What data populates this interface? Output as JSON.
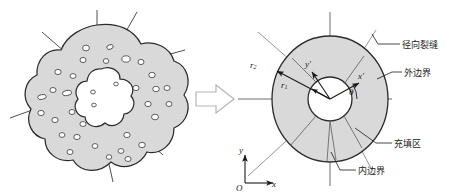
{
  "figure": {
    "type": "engineering-schematic",
    "colors": {
      "fill_gray": "#d9d9d9",
      "stroke_dark": "#2b2b2b",
      "stroke_mid": "#555555",
      "void_white": "#ffffff",
      "arrow_outline": "#b5b5b5",
      "background": "#ffffff"
    },
    "left_panel": {
      "name": "real-cross-section",
      "outer_boundary": "irregular lobed outline",
      "inner_void": "cloud-shaped central cavity",
      "radial_crack_count": 9,
      "void_count": 34
    },
    "transform_arrow": {
      "glyph": "block-arrow-right"
    },
    "right_panel": {
      "name": "idealized-annulus-model",
      "inner_radius_label": "r",
      "inner_radius_sub": "1",
      "outer_radius_label": "r",
      "outer_radius_sub": "2",
      "angle_label": "θ",
      "local_axis_x": "x",
      "local_axis_x_prime": "′",
      "local_axis_y": "y",
      "local_axis_y_prime": "′",
      "global_origin": "O",
      "global_axis_x": "x",
      "global_axis_y": "y",
      "callouts": [
        {
          "id": "radial-crack",
          "text": "径向裂缝"
        },
        {
          "id": "outer-boundary",
          "text": "外边界"
        },
        {
          "id": "filling-zone",
          "text": "充填区"
        },
        {
          "id": "inner-boundary",
          "text": "内边界"
        }
      ]
    }
  }
}
